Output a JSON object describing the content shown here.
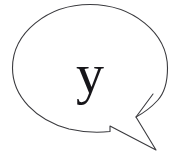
{
  "figure": {
    "type": "speech-balloon",
    "background_color": "#ffffff",
    "stroke_color": "#3a3a3e",
    "stroke_width": 1.1,
    "fill_color": "#ffffff"
  },
  "balloon": {
    "shape": "ellipse",
    "center_x": 90,
    "center_y": 68,
    "radius_x": 78,
    "radius_y": 64,
    "tail": {
      "shape": "pointed-polygon-with-notch",
      "direction": "lower-right",
      "attach_left_x": 110,
      "attach_left_y": 126,
      "tip_x": 156,
      "tip_y": 150,
      "notch_x": 136,
      "notch_y": 117,
      "attach_right_x": 153,
      "attach_right_y": 94
    }
  },
  "content": {
    "letter": "y",
    "letter_color": "#17161a",
    "letter_font_style": "serif",
    "letter_size_px": 56
  }
}
